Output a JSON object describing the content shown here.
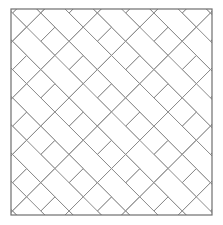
{
  "figure": {
    "title": "Herringbone Tile Pattern",
    "description": "Square tiling diagram filled with rectangular bricks laid in a herringbone arrangement at forty-five degrees.",
    "caption": ""
  },
  "canvas": {
    "width": 223,
    "height": 225,
    "background_color": "#ffffff"
  },
  "frame": {
    "name": "pattern-border",
    "x": 11,
    "y": 9,
    "width": 201,
    "height": 206,
    "stroke_color": "#6e6e6e",
    "stroke_width": 1.2,
    "fill_color": "#ffffff"
  },
  "pattern": {
    "type": "herringbone",
    "angle_degrees": 45,
    "brick_aspect_ratio": "2:1",
    "brick_short_side": 20,
    "brick_long_side": 40,
    "module_period": 40,
    "joint_stroke_color": "#8a8a8a",
    "joint_stroke_width": 1,
    "brick_fill_color": "#ffffff",
    "rows": 12,
    "columns": 12
  }
}
